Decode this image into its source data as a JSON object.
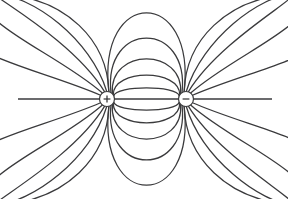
{
  "figure": {
    "type": "field-line-diagram",
    "background_color": "#ffffff",
    "line_color": "#3a3a3c",
    "line_width": 1.25,
    "width": 288,
    "height": 199
  },
  "charges": [
    {
      "id": "positive-charge",
      "name": "positive-charge",
      "sign_label": "+",
      "polarity": "positive",
      "cx": 107,
      "cy": 99,
      "radius": 7.5,
      "marker": "circle-with-plus"
    },
    {
      "id": "negative-charge",
      "name": "negative-charge",
      "sign_label": "−",
      "polarity": "negative",
      "cx": 186,
      "cy": 99,
      "radius": 7.5,
      "marker": "circle-with-minus"
    }
  ],
  "axis": {
    "name": "dipole-axis-line",
    "y": 99,
    "x_start": 18,
    "x_end": 272,
    "description": "straight horizontal field line joining the two charges and extending outward"
  },
  "chart_data": {
    "type": "line",
    "xlabel": "",
    "ylabel": "",
    "xlim": [
      0,
      288
    ],
    "ylim": [
      0,
      199
    ],
    "grid": false,
    "legend": null,
    "annotations": [
      {
        "text": "+",
        "x": 107,
        "y": 99
      },
      {
        "text": "−",
        "x": 186,
        "y": 99
      }
    ],
    "series": [
      {
        "name": "inner-arc-up-1",
        "bulge": 9,
        "side": "up",
        "group": "inner-arc"
      },
      {
        "name": "inner-arc-up-2",
        "bulge": 20,
        "side": "up",
        "group": "inner-arc"
      },
      {
        "name": "inner-arc-up-3",
        "bulge": 34,
        "side": "up",
        "group": "inner-arc"
      },
      {
        "name": "inner-arc-up-4",
        "bulge": 52,
        "side": "up",
        "group": "inner-arc"
      },
      {
        "name": "inner-arc-up-5",
        "bulge": 74,
        "side": "up",
        "group": "inner-arc"
      },
      {
        "name": "inner-arc-down-1",
        "bulge": 9,
        "side": "down",
        "group": "inner-arc"
      },
      {
        "name": "inner-arc-down-2",
        "bulge": 20,
        "side": "down",
        "group": "inner-arc"
      },
      {
        "name": "inner-arc-down-3",
        "bulge": 34,
        "side": "down",
        "group": "inner-arc"
      },
      {
        "name": "inner-arc-down-4",
        "bulge": 52,
        "side": "down",
        "group": "inner-arc"
      },
      {
        "name": "inner-arc-down-5",
        "bulge": 74,
        "side": "down",
        "group": "inner-arc"
      },
      {
        "name": "outer-line-upper-left-1",
        "exit_angle_deg": 150,
        "side": "up",
        "group": "outer-line"
      },
      {
        "name": "outer-line-upper-left-2",
        "exit_angle_deg": 128,
        "side": "up",
        "group": "outer-line"
      },
      {
        "name": "outer-line-upper-left-3",
        "exit_angle_deg": 108,
        "side": "up",
        "group": "outer-line"
      },
      {
        "name": "outer-line-upper-left-4",
        "exit_angle_deg": 92,
        "side": "up",
        "group": "outer-line"
      },
      {
        "name": "outer-line-upper-left-5",
        "exit_angle_deg": 76,
        "side": "up",
        "group": "outer-line"
      },
      {
        "name": "outer-line-lower-left-1",
        "exit_angle_deg": 210,
        "side": "down",
        "group": "outer-line"
      },
      {
        "name": "outer-line-lower-left-2",
        "exit_angle_deg": 232,
        "side": "down",
        "group": "outer-line"
      },
      {
        "name": "outer-line-lower-left-3",
        "exit_angle_deg": 252,
        "side": "down",
        "group": "outer-line"
      },
      {
        "name": "outer-line-lower-left-4",
        "exit_angle_deg": 268,
        "side": "down",
        "group": "outer-line"
      },
      {
        "name": "outer-line-lower-left-5",
        "exit_angle_deg": 284,
        "side": "down",
        "group": "outer-line"
      },
      {
        "name": "outer-line-upper-right-1",
        "exit_angle_deg": 30,
        "side": "up",
        "group": "outer-line"
      },
      {
        "name": "outer-line-upper-right-2",
        "exit_angle_deg": 52,
        "side": "up",
        "group": "outer-line"
      },
      {
        "name": "outer-line-upper-right-3",
        "exit_angle_deg": 72,
        "side": "up",
        "group": "outer-line"
      },
      {
        "name": "outer-line-upper-right-4",
        "exit_angle_deg": 88,
        "side": "up",
        "group": "outer-line"
      },
      {
        "name": "outer-line-upper-right-5",
        "exit_angle_deg": 104,
        "side": "up",
        "group": "outer-line"
      },
      {
        "name": "outer-line-lower-right-1",
        "exit_angle_deg": 330,
        "side": "down",
        "group": "outer-line"
      },
      {
        "name": "outer-line-lower-right-2",
        "exit_angle_deg": 308,
        "side": "down",
        "group": "outer-line"
      },
      {
        "name": "outer-line-lower-right-3",
        "exit_angle_deg": 288,
        "side": "down",
        "group": "outer-line"
      },
      {
        "name": "outer-line-lower-right-4",
        "exit_angle_deg": 272,
        "side": "down",
        "group": "outer-line"
      },
      {
        "name": "outer-line-lower-right-5",
        "exit_angle_deg": 256,
        "side": "down",
        "group": "outer-line"
      }
    ],
    "counts": {
      "inner_arcs_upper": 5,
      "inner_arcs_lower": 5,
      "outer_lines_left": 10,
      "outer_lines_right": 10,
      "straight_axis_lines": 1
    }
  }
}
